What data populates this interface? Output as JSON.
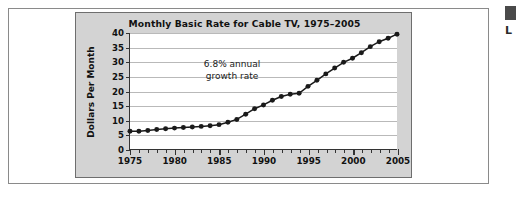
{
  "chart_data": {
    "type": "line",
    "title": "Monthly Basic Rate for Cable TV, 1975–2005",
    "xlabel": "",
    "ylabel": "Dollars Per Month",
    "xlim": [
      1975,
      2005
    ],
    "ylim": [
      0,
      40
    ],
    "ytick_step": 5,
    "xtick_major_step": 5,
    "xtick_minor_step": 1,
    "grid": "horizontal",
    "legend": "none",
    "marker": "filled-circle",
    "line_color": "#1a1a1a",
    "annotations": [
      {
        "text_line1": "6.8% annual",
        "text_line2": "growth rate",
        "x": 1984.5,
        "y": 26
      }
    ],
    "ytick_labels": [
      "0",
      "5",
      "10",
      "15",
      "20",
      "25",
      "30",
      "35",
      "40"
    ],
    "xtick_labels": [
      "1975",
      "1980",
      "1985",
      "1990",
      "1995",
      "2000",
      "2005"
    ],
    "x": [
      1975,
      1976,
      1977,
      1978,
      1979,
      1980,
      1981,
      1982,
      1983,
      1984,
      1985,
      1986,
      1987,
      1988,
      1989,
      1990,
      1991,
      1992,
      1993,
      1994,
      1995,
      1996,
      1997,
      1998,
      1999,
      2000,
      2001,
      2002,
      2003,
      2004,
      2005
    ],
    "values": [
      6.1,
      6.1,
      6.4,
      6.7,
      7.0,
      7.2,
      7.4,
      7.6,
      7.8,
      8.0,
      8.4,
      9.2,
      10.2,
      12.0,
      13.9,
      15.2,
      16.8,
      18.1,
      18.9,
      19.2,
      21.6,
      23.7,
      25.9,
      27.9,
      29.9,
      31.3,
      33.2,
      35.3,
      37.0,
      38.2,
      39.6
    ],
    "series": [
      {
        "name": "Monthly basic rate",
        "values": [
          6.1,
          6.1,
          6.4,
          6.7,
          7.0,
          7.2,
          7.4,
          7.6,
          7.8,
          8.0,
          8.4,
          9.2,
          10.2,
          12.0,
          13.9,
          15.2,
          16.8,
          18.1,
          18.9,
          19.2,
          21.6,
          23.7,
          25.9,
          27.9,
          29.9,
          31.3,
          33.2,
          35.3,
          37.0,
          38.2,
          39.6
        ]
      }
    ]
  },
  "edge_marks": {
    "glyph": "L"
  }
}
